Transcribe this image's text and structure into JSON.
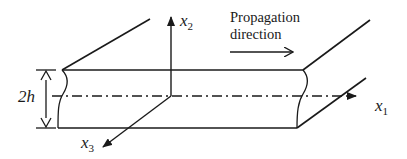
{
  "diagram": {
    "type": "plate-waveguide-schematic",
    "labels": {
      "x1": {
        "base": "x",
        "sub": "1"
      },
      "x2": {
        "base": "x",
        "sub": "2"
      },
      "x3": {
        "base": "x",
        "sub": "3"
      },
      "thickness": "2h",
      "propagation_line1": "Propagation",
      "propagation_line2": "direction"
    },
    "colors": {
      "line": "#1a1a1a",
      "background": "#ffffff"
    }
  }
}
